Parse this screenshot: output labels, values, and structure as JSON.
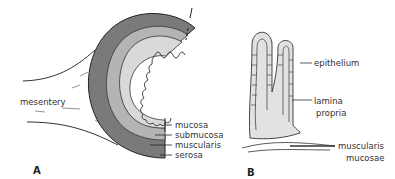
{
  "panel_a": {
    "letter": "A",
    "labels": {
      "mesentery": "mesentery",
      "mucosa": "mucosa",
      "submucosa": "submucosa",
      "muscularis": "muscularis",
      "serosa": "serosa"
    }
  },
  "panel_b": {
    "letter": "B",
    "labels": {
      "epithelium": "epithelium",
      "lamina_propria_1": "lamina",
      "lamina_propria_2": "propria",
      "muscularis_mucosae_1": "muscularis",
      "muscularis_mucosae_2": "mucosae"
    }
  },
  "colors": {
    "serosa_muscularis": "#7a7a7a",
    "submucosa": "#b4b4b4",
    "mucosa": "#d9d9d9",
    "lamina": "#e2e2e2",
    "line": "#222222"
  }
}
